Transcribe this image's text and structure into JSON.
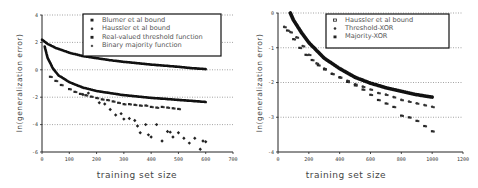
{
  "chart_data": [
    {
      "type": "scatter",
      "panel": "left",
      "title": "",
      "xlabel": "training set size",
      "ylabel": "ln(generalization error)",
      "xlim": [
        0,
        700
      ],
      "ylim": [
        -6,
        4
      ],
      "xticks": [
        0,
        100,
        200,
        300,
        400,
        500,
        600,
        700
      ],
      "yticks": [
        4,
        2,
        0,
        -2,
        -4,
        -6
      ],
      "grid": "horizontal dotted",
      "legend_position": "top-right",
      "series": [
        {
          "name": "Blumer et al bound",
          "marker": "square",
          "style": "dense-curve",
          "x": [
            0,
            20,
            50,
            100,
            150,
            200,
            250,
            300,
            350,
            400,
            450,
            500,
            550,
            600
          ],
          "y": [
            2.2,
            1.9,
            1.6,
            1.25,
            1.0,
            0.85,
            0.7,
            0.58,
            0.48,
            0.38,
            0.3,
            0.22,
            0.12,
            0.05
          ]
        },
        {
          "name": "Haussler et al bound",
          "marker": "circle",
          "style": "dense-curve",
          "x": [
            10,
            20,
            40,
            60,
            100,
            150,
            200,
            250,
            300,
            350,
            400,
            450,
            500,
            550,
            600
          ],
          "y": [
            1.7,
            0.9,
            0.1,
            -0.4,
            -0.9,
            -1.3,
            -1.55,
            -1.7,
            -1.85,
            -1.95,
            -2.05,
            -2.12,
            -2.2,
            -2.27,
            -2.35
          ]
        },
        {
          "name": "Real-valued threshold function",
          "marker": "square-small",
          "x": [
            30,
            50,
            70,
            100,
            120,
            140,
            160,
            180,
            200,
            220,
            240,
            260,
            280,
            300,
            320,
            340,
            360,
            380,
            400,
            420,
            440,
            460,
            480,
            500
          ],
          "y": [
            -0.5,
            -0.8,
            -1.1,
            -1.4,
            -1.6,
            -1.75,
            -1.85,
            -1.95,
            -2.05,
            -2.15,
            -2.2,
            -2.3,
            -2.4,
            -2.5,
            -2.5,
            -2.55,
            -2.6,
            -2.6,
            -2.7,
            -2.75,
            -2.7,
            -2.75,
            -2.8,
            -2.85
          ]
        },
        {
          "name": "Binary majority function",
          "marker": "diamond",
          "x": [
            150,
            170,
            210,
            230,
            250,
            270,
            290,
            300,
            320,
            340,
            350,
            360,
            380,
            390,
            400,
            420,
            440,
            460,
            470,
            480,
            500,
            520,
            540,
            560,
            580,
            590,
            600
          ],
          "y": [
            -1.8,
            -1.7,
            -2.4,
            -2.5,
            -2.9,
            -3.3,
            -3.2,
            -3.6,
            -3.55,
            -3.7,
            -4.1,
            -4.6,
            -4.0,
            -4.75,
            -4.9,
            -4.0,
            -5.2,
            -4.5,
            -4.55,
            -4.9,
            -4.6,
            -5.0,
            -5.35,
            -5.0,
            -5.8,
            -5.2,
            -5.25
          ]
        }
      ]
    },
    {
      "type": "scatter",
      "panel": "right",
      "title": "",
      "xlabel": "training set size",
      "ylabel": "ln(generalization error)",
      "xlim": [
        0,
        1200
      ],
      "ylim": [
        -4,
        0
      ],
      "xticks": [
        0,
        200,
        400,
        600,
        800,
        1000,
        1200
      ],
      "yticks": [
        0,
        -1,
        -2,
        -3,
        -4
      ],
      "grid": "horizontal dotted",
      "legend_position": "top-right",
      "series": [
        {
          "name": "Haussler et al bound",
          "marker": "square-open",
          "style": "dense-curve",
          "x": [
            80,
            100,
            150,
            200,
            300,
            400,
            500,
            600,
            700,
            800,
            900,
            1000
          ],
          "y": [
            0.0,
            -0.2,
            -0.55,
            -0.85,
            -1.3,
            -1.6,
            -1.85,
            -2.02,
            -2.15,
            -2.25,
            -2.35,
            -2.42
          ]
        },
        {
          "name": "Threshold-XOR",
          "marker": "circle",
          "x": [
            40,
            80,
            120,
            160,
            200,
            250,
            300,
            350,
            400,
            450,
            500,
            550,
            600,
            650,
            700,
            750,
            800,
            850,
            900,
            950,
            1000
          ],
          "y": [
            -0.4,
            -0.55,
            -0.7,
            -0.95,
            -1.2,
            -1.45,
            -1.6,
            -1.75,
            -1.85,
            -1.95,
            -2.05,
            -2.12,
            -2.2,
            -2.3,
            -2.35,
            -2.42,
            -2.5,
            -2.55,
            -2.6,
            -2.65,
            -2.7
          ]
        },
        {
          "name": "Majority-XOR",
          "marker": "square",
          "x": [
            60,
            100,
            140,
            180,
            220,
            260,
            300,
            350,
            400,
            450,
            500,
            550,
            600,
            650,
            700,
            750,
            800,
            850,
            900,
            950,
            1000
          ],
          "y": [
            -0.5,
            -0.75,
            -1.0,
            -1.2,
            -1.35,
            -1.5,
            -1.62,
            -1.75,
            -1.85,
            -1.98,
            -2.08,
            -2.2,
            -2.35,
            -2.5,
            -2.6,
            -2.7,
            -2.95,
            -3.0,
            -3.1,
            -3.25,
            -3.4
          ]
        }
      ]
    }
  ],
  "labels": {
    "left_xlabel": "training set size",
    "left_ylabel": "ln(generalization error)",
    "right_xlabel": "training set size",
    "right_ylabel": "ln(generalization error)",
    "left_legend": [
      "Blumer et al bound",
      "Haussler et al bound",
      "Real-valued threshold function",
      "Binary majority function"
    ],
    "right_legend": [
      "Haussler et al bound",
      "Threshold-XOR",
      "Majority-XOR"
    ]
  }
}
